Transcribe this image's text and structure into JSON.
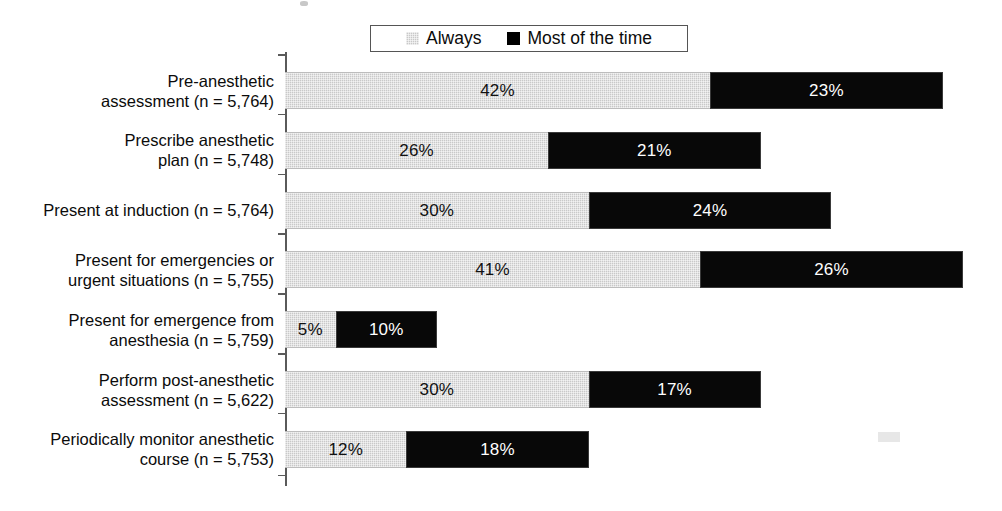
{
  "legend": {
    "entries": [
      {
        "label": "Always",
        "swatch": "gray-swatch-icon",
        "color": "#c9c9c9"
      },
      {
        "label": "Most of the time",
        "swatch": "black-swatch-icon",
        "color": "#000000"
      }
    ]
  },
  "chart_data": {
    "type": "bar",
    "orientation": "horizontal",
    "stacked": true,
    "title": "",
    "xlabel": "",
    "ylabel": "",
    "xlim": [
      0,
      70
    ],
    "grid": false,
    "legend_position": "top-center",
    "value_suffix": "%",
    "categories": [
      "Pre-anesthetic\nassessment (n = 5,764)",
      "Prescribe anesthetic\nplan (n = 5,748)",
      "Present at induction (n = 5,764)",
      "Present for emergencies or\nurgent situations (n = 5,755)",
      "Present for emergence from\nanesthesia (n = 5,759)",
      "Perform post-anesthetic\nassessment (n = 5,622)",
      "Periodically monitor anesthetic\ncourse (n = 5,753)"
    ],
    "series": [
      {
        "name": "Always",
        "color": "#c9c9c9",
        "values": [
          42,
          26,
          30,
          41,
          5,
          30,
          12
        ],
        "labels": [
          "42%",
          "26%",
          "30%",
          "41%",
          "5%",
          "30%",
          "12%"
        ]
      },
      {
        "name": "Most of the time",
        "color": "#000000",
        "values": [
          23,
          21,
          24,
          26,
          10,
          17,
          18
        ],
        "labels": [
          "23%",
          "21%",
          "24%",
          "26%",
          "10%",
          "17%",
          "18%"
        ]
      }
    ],
    "totals": [
      65,
      47,
      54,
      67,
      15,
      47,
      30
    ]
  }
}
